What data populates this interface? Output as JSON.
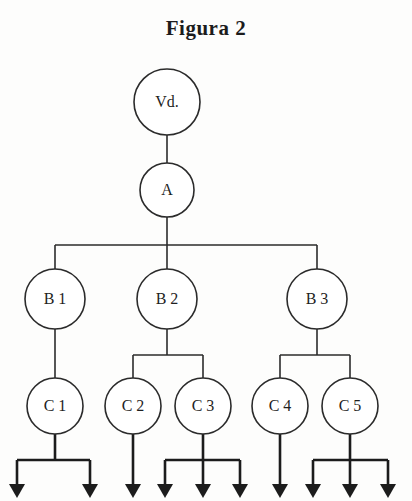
{
  "figure": {
    "title": "Figura 2",
    "type": "hierarchy-tree",
    "background_color": "#fdfdfc",
    "line_color": "#2b2b2b",
    "arrow_color": "#1c1c1c"
  },
  "nodes": {
    "root": {
      "label": "Vd.",
      "cx": 167,
      "cy": 102,
      "r": 33
    },
    "level_a": {
      "label": "A",
      "cx": 167,
      "cy": 190,
      "r": 27
    },
    "level_b": [
      {
        "label": "B 1",
        "cx": 55,
        "cy": 299,
        "r": 30
      },
      {
        "label": "B 2",
        "cx": 167,
        "cy": 299,
        "r": 30
      },
      {
        "label": "B 3",
        "cx": 317,
        "cy": 299,
        "r": 30
      }
    ],
    "level_c": [
      {
        "label": "C 1",
        "cx": 55,
        "cy": 406,
        "r": 28
      },
      {
        "label": "C 2",
        "cx": 133,
        "cy": 406,
        "r": 28
      },
      {
        "label": "C 3",
        "cx": 203,
        "cy": 406,
        "r": 28
      },
      {
        "label": "C 4",
        "cx": 280,
        "cy": 406,
        "r": 28
      },
      {
        "label": "C 5",
        "cx": 350,
        "cy": 406,
        "r": 28
      }
    ]
  },
  "edges": {
    "root_to_a": {
      "from": "Vd.",
      "to": "A"
    },
    "a_to_b": {
      "from": "A",
      "to": [
        "B 1",
        "B 2",
        "B 3"
      ],
      "bar_y": 245
    },
    "b1_to_c": {
      "from": "B 1",
      "to": [
        "C 1"
      ]
    },
    "b2_to_c": {
      "from": "B 2",
      "to": [
        "C 2",
        "C 3"
      ],
      "bar_y": 355
    },
    "b3_to_c": {
      "from": "B 3",
      "to": [
        "C 4",
        "C 5"
      ],
      "bar_y": 355
    }
  },
  "terminal_arrows": {
    "count": 10,
    "groups": [
      {
        "parent": "C 1",
        "bar_y": 460,
        "x_positions": [
          17,
          90
        ]
      },
      {
        "parent": "C 2",
        "bar_y": null,
        "x_positions": [
          133
        ]
      },
      {
        "parent": "C 3",
        "bar_y": 460,
        "x_positions": [
          165,
          203,
          240
        ]
      },
      {
        "parent": "C 4",
        "bar_y": null,
        "x_positions": [
          280
        ]
      },
      {
        "parent": "C 5",
        "bar_y": 460,
        "x_positions": [
          313,
          350,
          388
        ]
      }
    ],
    "tip_y": 498
  }
}
